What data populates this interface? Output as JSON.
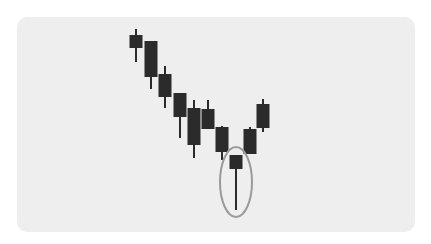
{
  "chart_data": {
    "type": "candlestick",
    "title": "",
    "xlabel": "",
    "ylabel": "",
    "grid": false,
    "legend": null,
    "annotation": "Ellipse highlighting hammer candle with long lower wick",
    "candles": [
      {
        "x": 136,
        "body_top": 35,
        "body_bottom": 48,
        "wick_top": 29,
        "wick_bottom": 62
      },
      {
        "x": 151,
        "body_top": 41,
        "body_bottom": 77,
        "wick_top": 41,
        "wick_bottom": 89
      },
      {
        "x": 165,
        "body_top": 74,
        "body_bottom": 97,
        "wick_top": 66,
        "wick_bottom": 108
      },
      {
        "x": 180,
        "body_top": 93,
        "body_bottom": 117,
        "wick_top": 93,
        "wick_bottom": 138
      },
      {
        "x": 194,
        "body_top": 108,
        "body_bottom": 145,
        "wick_top": 100,
        "wick_bottom": 158
      },
      {
        "x": 208,
        "body_top": 109,
        "body_bottom": 129,
        "wick_top": 100,
        "wick_bottom": 129
      },
      {
        "x": 222,
        "body_top": 127,
        "body_bottom": 152,
        "wick_top": 126,
        "wick_bottom": 160
      },
      {
        "x": 236,
        "body_top": 155,
        "body_bottom": 169,
        "wick_top": 155,
        "wick_bottom": 210
      },
      {
        "x": 250,
        "body_top": 129,
        "body_bottom": 154,
        "wick_top": 127,
        "wick_bottom": 154
      },
      {
        "x": 263,
        "body_top": 104,
        "body_bottom": 128,
        "wick_top": 99,
        "wick_bottom": 132
      }
    ],
    "highlight": {
      "cx": 236,
      "cy": 182,
      "rx": 16,
      "ry": 35,
      "color": "#9a9a9a"
    },
    "colors": {
      "candle": "#2b2b2b",
      "background": "#eeeeee"
    }
  }
}
